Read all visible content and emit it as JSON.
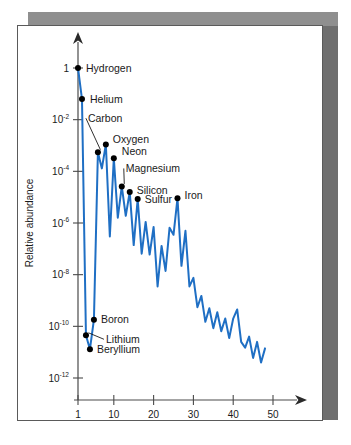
{
  "chart_data": {
    "type": "line",
    "title": "",
    "xlabel": "Atomic number",
    "ylabel": "Relative abundance",
    "xlim": [
      0,
      52
    ],
    "ylim": [
      1e-12,
      3
    ],
    "yscale": "log",
    "grid": false,
    "legend": null,
    "line_color": "#1f6fc4",
    "xticks": [
      1,
      10,
      20,
      30,
      40,
      50
    ],
    "xtick_labels": [
      "1",
      "10",
      "20",
      "30",
      "40",
      "50"
    ],
    "yticks": [
      1,
      0.01,
      0.0001,
      1e-06,
      1e-08,
      1e-10,
      1e-12
    ],
    "ytick_labels": [
      {
        "mantissa": "1",
        "exponent": ""
      },
      {
        "mantissa": "10",
        "exponent": "-2"
      },
      {
        "mantissa": "10",
        "exponent": "-4"
      },
      {
        "mantissa": "10",
        "exponent": "-6"
      },
      {
        "mantissa": "10",
        "exponent": "-8"
      },
      {
        "mantissa": "10",
        "exponent": "-10"
      },
      {
        "mantissa": "10",
        "exponent": "-12"
      }
    ],
    "x": [
      1,
      2,
      3,
      4,
      5,
      6,
      7,
      8,
      9,
      10,
      11,
      12,
      13,
      14,
      15,
      16,
      17,
      18,
      19,
      20,
      21,
      22,
      23,
      24,
      25,
      26,
      27,
      28,
      29,
      30,
      31,
      32,
      33,
      34,
      35,
      36,
      37,
      38,
      39,
      40,
      41,
      42,
      43,
      44,
      45,
      46,
      47,
      48
    ],
    "values": [
      1.0,
      0.063,
      4.5e-11,
      1.3e-11,
      1.8e-10,
      0.00055,
      0.00013,
      0.0011,
      3e-07,
      0.00032,
      1.6e-06,
      2.6e-05,
      1.9e-06,
      1.6e-05,
      1.4e-07,
      8.5e-06,
      6.5e-08,
      1.1e-06,
      6e-08,
      7e-07,
      3.5e-09,
      1.3e-07,
      1.4e-08,
      6.5e-07,
      3.5e-07,
      9e-06,
      2.2e-08,
      5e-07,
      3.5e-09,
      7.5e-09,
      5.5e-10,
      1.5e-09,
      1.5e-10,
      5e-10,
      8.5e-11,
      3.5e-10,
      6.5e-11,
      2e-10,
      3.5e-11,
      2e-10,
      4.5e-10,
      2.5e-11,
      1.5e-11,
      4e-11,
      6e-12,
      2.5e-11,
      4e-12,
      1.4e-11
    ],
    "annotations": [
      {
        "label": "Hydrogen",
        "x": 1,
        "y": 1.0,
        "label_dx": 8,
        "label_dy": 4,
        "marker": true,
        "leader": false
      },
      {
        "label": "Helium",
        "x": 2,
        "y": 0.063,
        "label_dx": 8,
        "label_dy": 4,
        "marker": true,
        "leader": false
      },
      {
        "label": "Carbon",
        "x": 6,
        "y": 0.00055,
        "label_dx": -10,
        "label_dy": -30,
        "marker": true,
        "leader": true
      },
      {
        "label": "Oxygen",
        "x": 8,
        "y": 0.0011,
        "label_dx": 7,
        "label_dy": -1,
        "marker": true,
        "leader": false
      },
      {
        "label": "Neon",
        "x": 10,
        "y": 0.00032,
        "label_dx": 8,
        "label_dy": -3,
        "marker": true,
        "leader": false
      },
      {
        "label": "Magnesium",
        "x": 12,
        "y": 2.6e-05,
        "label_dx": 4,
        "label_dy": -14,
        "marker": true,
        "leader": true
      },
      {
        "label": "Silicon",
        "x": 14,
        "y": 1.6e-05,
        "label_dx": 7,
        "label_dy": 2,
        "marker": true,
        "leader": false
      },
      {
        "label": "Sulfur",
        "x": 16,
        "y": 8.5e-06,
        "label_dx": 7,
        "label_dy": 4,
        "marker": true,
        "leader": false
      },
      {
        "label": "Iron",
        "x": 26,
        "y": 9e-06,
        "label_dx": 7,
        "label_dy": 1,
        "marker": true,
        "leader": false
      },
      {
        "label": "Boron",
        "x": 5,
        "y": 1.8e-10,
        "label_dx": 7,
        "label_dy": 3,
        "marker": true,
        "leader": false
      },
      {
        "label": "Lithium",
        "x": 3,
        "y": 4.5e-11,
        "label_dx": 20,
        "label_dy": 8,
        "marker": true,
        "leader": true
      },
      {
        "label": "Beryllium",
        "x": 4,
        "y": 1.3e-11,
        "label_dx": 7,
        "label_dy": 4,
        "marker": true,
        "leader": false
      }
    ]
  }
}
